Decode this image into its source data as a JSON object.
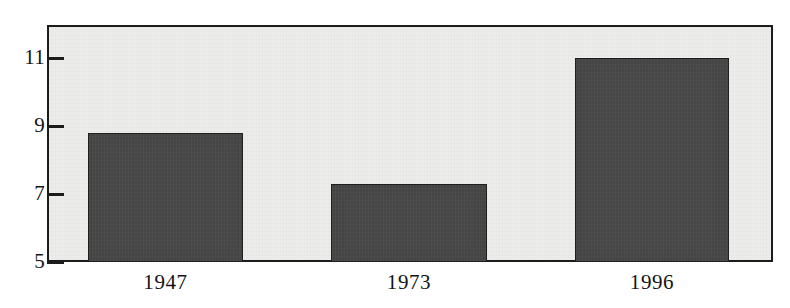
{
  "chart_data": {
    "type": "bar",
    "title": "",
    "subtitle": "",
    "xlabel": "",
    "ylabel": "",
    "categories": [
      "1947",
      "1973",
      "1996"
    ],
    "values": [
      8.8,
      7.3,
      11.0
    ],
    "series": [
      {
        "name": "value",
        "values": [
          8.8,
          7.3,
          11.0
        ],
        "color": "#494949"
      }
    ],
    "ylim": [
      5,
      12.1
    ],
    "yticks": [
      5,
      7,
      9,
      11
    ],
    "ytick_labels": [
      "5",
      "7",
      "9",
      "11"
    ],
    "xtick_labels": [
      "1947",
      "1973",
      "1996"
    ],
    "grid": false,
    "legend": null,
    "annotations": [],
    "bar_color": "#494949",
    "bar_edge_color": "#1f1f1f",
    "plot_background": "#ececeb",
    "axis_color": "#1c1c1c",
    "page_background": "#ffffff"
  },
  "axes": {
    "y": {
      "ticks": [
        {
          "label": "11",
          "value": 11
        },
        {
          "label": "9",
          "value": 9
        },
        {
          "label": "7",
          "value": 7
        },
        {
          "label": "5",
          "value": 5
        }
      ]
    },
    "x": {
      "ticks": [
        {
          "label": "1947"
        },
        {
          "label": "1973"
        },
        {
          "label": "1996"
        }
      ]
    }
  },
  "bars": [
    {
      "category": "1947",
      "value": 8.8
    },
    {
      "category": "1973",
      "value": 7.3
    },
    {
      "category": "1996",
      "value": 11.0
    }
  ]
}
